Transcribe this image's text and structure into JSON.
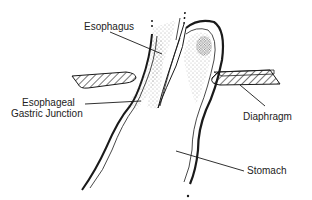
{
  "diagram": {
    "labels": {
      "esophagus": "Esophagus",
      "ege_line1": "Esophageal",
      "ege_line2": "Gastric Junction",
      "diaphragm": "Diaphragm",
      "stomach": "Stomach"
    },
    "colors": {
      "ink": "#1a1a1a",
      "background": "#ffffff"
    }
  }
}
